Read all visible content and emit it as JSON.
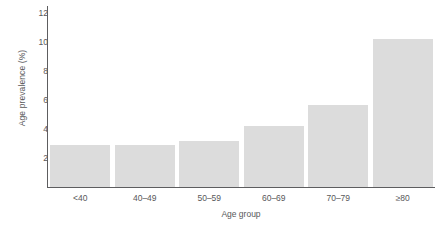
{
  "chart_data": {
    "type": "bar",
    "title": "",
    "xlabel": "Age group",
    "ylabel": "Age prevalence (%)",
    "categories": [
      "<40",
      "40–49",
      "50–59",
      "60–69",
      "70–79",
      "≥80"
    ],
    "values": [
      2.9,
      2.9,
      3.2,
      4.2,
      5.65,
      10.2
    ],
    "yticks": [
      2,
      4,
      6,
      8,
      10,
      12
    ],
    "ylim": [
      0,
      12.5
    ],
    "grid": false,
    "legend": null,
    "bar_color": "#dcdcdc",
    "axis_color": "#5d5d5f",
    "text_color": "#58585a"
  }
}
